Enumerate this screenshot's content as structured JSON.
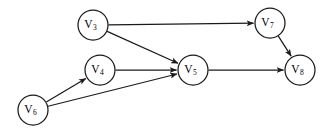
{
  "diagram": {
    "type": "directed-graph",
    "background_color": "#ffffff",
    "stroke_color": "#1a1a1a",
    "node_fill_color": "#ffffff",
    "label_color": "#000000",
    "node_radius": 15,
    "nodes": [
      {
        "id": "V3",
        "label": "V",
        "subscript": "3",
        "cx": 93,
        "cy": 25
      },
      {
        "id": "V7",
        "label": "V",
        "subscript": "7",
        "cx": 270,
        "cy": 23
      },
      {
        "id": "V4",
        "label": "V",
        "subscript": "4",
        "cx": 100,
        "cy": 70
      },
      {
        "id": "V5",
        "label": "V",
        "subscript": "5",
        "cx": 193,
        "cy": 70
      },
      {
        "id": "V8",
        "label": "V",
        "subscript": "8",
        "cx": 300,
        "cy": 70
      },
      {
        "id": "V6",
        "label": "V",
        "subscript": "6",
        "cx": 33,
        "cy": 110
      }
    ],
    "edges": [
      {
        "id": "e-v3-v7",
        "from": "V3",
        "to": "V7",
        "directed": true
      },
      {
        "id": "e-v3-v5",
        "from": "V3",
        "to": "V5",
        "directed": true
      },
      {
        "id": "e-v7-v8",
        "from": "V7",
        "to": "V8",
        "directed": true
      },
      {
        "id": "e-v4-v5",
        "from": "V4",
        "to": "V5",
        "directed": true
      },
      {
        "id": "e-v5-v8",
        "from": "V5",
        "to": "V8",
        "directed": true
      },
      {
        "id": "e-v6-v4",
        "from": "V6",
        "to": "V4",
        "directed": true
      },
      {
        "id": "e-v6-v5",
        "from": "V6",
        "to": "V5",
        "directed": true
      }
    ]
  }
}
